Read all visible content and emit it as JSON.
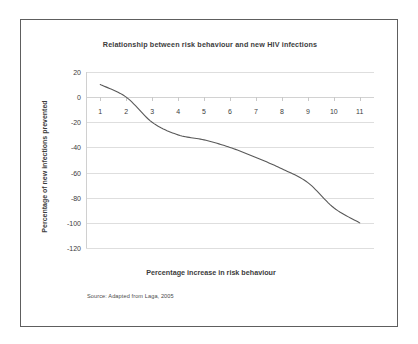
{
  "chart_data": {
    "type": "line",
    "title": "Relationship between risk behaviour and new HIV infections",
    "xlabel": "Percentage increase in risk behaviour",
    "ylabel": "Percentage of new infections prevented",
    "source": "Source: Adapted from Laga, 2005",
    "x": [
      1,
      2,
      3,
      4,
      5,
      6,
      7,
      8,
      9,
      10,
      11
    ],
    "values": [
      10,
      0,
      -20,
      -30,
      -34,
      -40,
      -48,
      -57,
      -68,
      -88,
      -100
    ],
    "series": [
      {
        "name": "Percentage of new infections prevented",
        "values": [
          10,
          0,
          -20,
          -30,
          -34,
          -40,
          -48,
          -57,
          -68,
          -88,
          -100
        ]
      }
    ],
    "xlim": [
      0.45,
      11.55
    ],
    "ylim": [
      -120,
      20
    ],
    "yticks": [
      20,
      0,
      -20,
      -40,
      -60,
      -80,
      -100,
      -120
    ],
    "ytick_labels": [
      "20",
      "0",
      "-20",
      "-40",
      "-60",
      "-80",
      "-100",
      "-120"
    ],
    "xticks": [
      1,
      2,
      3,
      4,
      5,
      6,
      7,
      8,
      9,
      10,
      11
    ],
    "xtick_labels": [
      "1",
      "2",
      "3",
      "4",
      "5",
      "6",
      "7",
      "8",
      "9",
      "10",
      "11"
    ],
    "grid": true,
    "legend": false,
    "line_color": "#595959",
    "grid_color": "#dedede",
    "background_color": "#ffffff",
    "border_color": "#5e5e5e"
  }
}
